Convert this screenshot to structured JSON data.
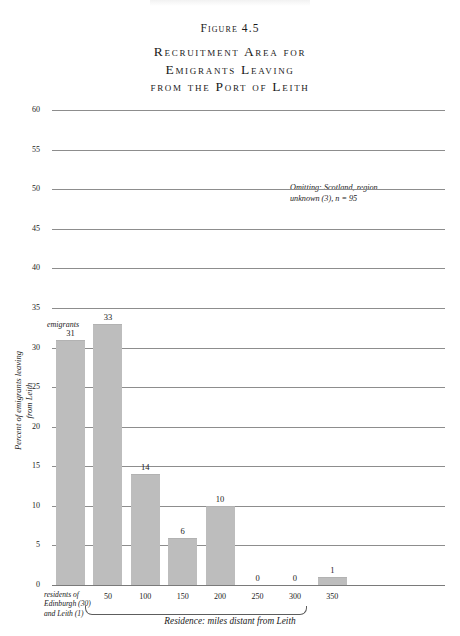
{
  "figure": {
    "number": "Figure 4.5",
    "title_lines": [
      "Recruitment Area for",
      "Emigrants Leaving",
      "from the Port of Leith"
    ]
  },
  "annotation": {
    "line1": "Omitting: Scotland, region",
    "line2": "unknown (3),  n = 95"
  },
  "notes": {
    "emigrants_note": "emigrants"
  },
  "chart_data": {
    "type": "bar",
    "title": "Recruitment Area for Emigrants Leaving from the Port of Leith",
    "xlabel": "Residence: miles distant from Leith",
    "ylabel": "Percent of emigrants leaving from Leith",
    "ylabel_line1": "Percent of emigrants leaving",
    "ylabel_line2": "from Leith",
    "categories": [
      "residents of Edinburgh (30) and Leith (1)",
      "50",
      "100",
      "150",
      "200",
      "250",
      "300",
      "350"
    ],
    "category_tick_labels": [
      "",
      "50",
      "100",
      "150",
      "200",
      "250",
      "300",
      "350"
    ],
    "first_category_label_lines": [
      "residents of",
      "Edinburgh (30)",
      "and Leith (1)"
    ],
    "values": [
      31,
      33,
      14,
      6,
      10,
      0,
      0,
      1
    ],
    "value_labels": [
      "31",
      "33",
      "14",
      "6",
      "10",
      "0",
      "0",
      "1"
    ],
    "ylim": [
      0,
      60
    ],
    "yticks": [
      0,
      5,
      10,
      15,
      20,
      25,
      30,
      35,
      40,
      45,
      50,
      55,
      60
    ],
    "ytick_labels": [
      "0",
      "5",
      "10",
      "15",
      "20",
      "25",
      "30",
      "35",
      "40",
      "45",
      "50",
      "55",
      "60"
    ],
    "grid": true,
    "legend": "none",
    "bar_color": "#bdbdbd",
    "grid_color": "#8d8d8d",
    "n": 95,
    "annotation": "Omitting: Scotland, region unknown (3), n = 95"
  }
}
